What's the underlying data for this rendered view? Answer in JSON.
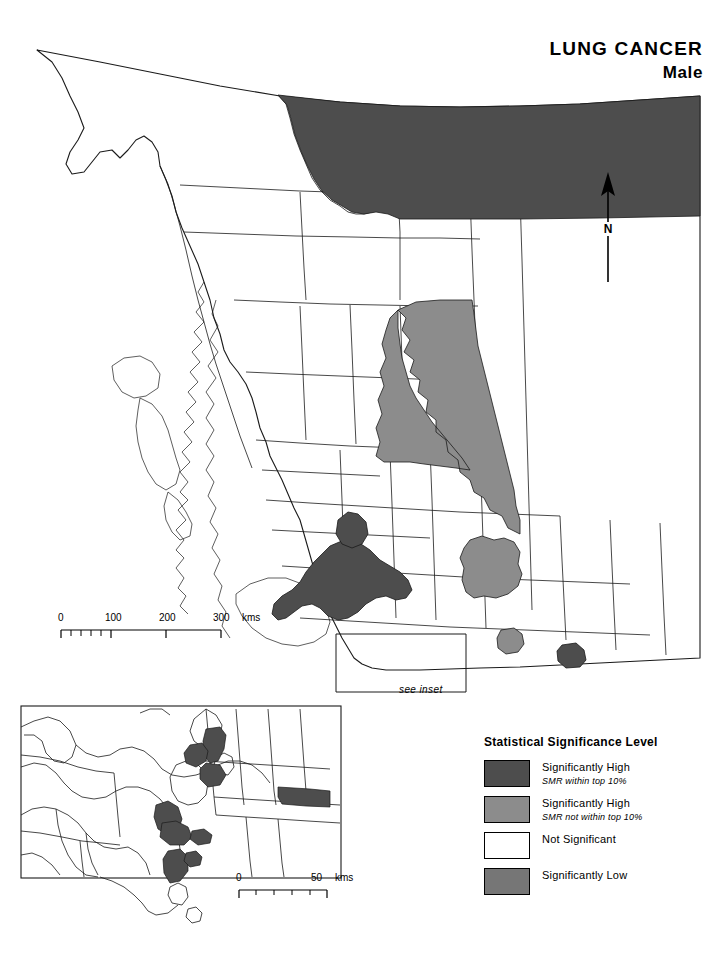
{
  "title": {
    "main": "LUNG CANCER",
    "sub": "Male"
  },
  "north_arrow": {
    "label": "N",
    "icon": "north-arrow-icon"
  },
  "scale_main": {
    "ticks": [
      "0",
      "100",
      "200",
      "300"
    ],
    "unit": "kms",
    "max_km": 300
  },
  "scale_inset": {
    "ticks": [
      "0",
      "50"
    ],
    "unit": "kms",
    "max_km": 50
  },
  "inset": {
    "callout_label": "see inset"
  },
  "legend": {
    "title": "Statistical Significance Level",
    "items": [
      {
        "label": "Significantly High",
        "sublabel": "SMR within top 10%",
        "color": "#4d4d4d"
      },
      {
        "label": "Significantly High",
        "sublabel": "SMR not within top 10%",
        "color": "#8c8c8c"
      },
      {
        "label": "Not Significant",
        "sublabel": "",
        "color": "#ffffff"
      },
      {
        "label": "Significantly Low",
        "sublabel": "",
        "color": "#767676"
      }
    ]
  },
  "map_colors": {
    "high_top10": "#4d4d4d",
    "high_other": "#8c8c8c",
    "not_significant": "#ffffff",
    "low": "#767676",
    "outline": "#1a1a1a"
  }
}
